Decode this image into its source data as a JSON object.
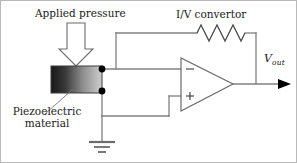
{
  "figure": {
    "type": "circuit-diagram",
    "title_text": "",
    "background_color": "#ffffff",
    "border_color": "#b9b9b9",
    "wire_color": "#808080",
    "outline_color": "#4d4d4d",
    "node_color": "#000000"
  },
  "labels": {
    "applied_pressure": "Applied pressure",
    "iv_convertor": "I/V convertor",
    "piezoelectric_line1": "Piezoelectric",
    "piezoelectric_line2": "material",
    "vout_symbol": "V",
    "vout_subscript": "out"
  },
  "components": {
    "pressure_arrow": {
      "name": "applied-pressure-arrow",
      "direction": "down",
      "fill": "#ffffff",
      "stroke": "#6b6b6b"
    },
    "piezo_block": {
      "name": "piezoelectric-material-block",
      "gradient_from": "#181818",
      "gradient_to": "#cfcfcf",
      "stroke": "#3d3d3d"
    },
    "op_amp": {
      "name": "operational-amplifier",
      "inverting_input": "−",
      "non_inverting_input": "+",
      "stroke": "#6b6b6b",
      "fill": "#ffffff"
    },
    "resistor": {
      "name": "feedback-resistor",
      "zigzag_peaks": 3,
      "stroke": "#4a4a4a"
    },
    "ground": {
      "name": "ground-symbol",
      "bars": 3,
      "stroke": "#6b6b6b"
    },
    "nodes": [
      {
        "name": "top-electrode-node"
      },
      {
        "name": "bottom-electrode-node"
      }
    ],
    "output_arrow": {
      "name": "vout-arrowhead",
      "fill": "#000000"
    }
  }
}
